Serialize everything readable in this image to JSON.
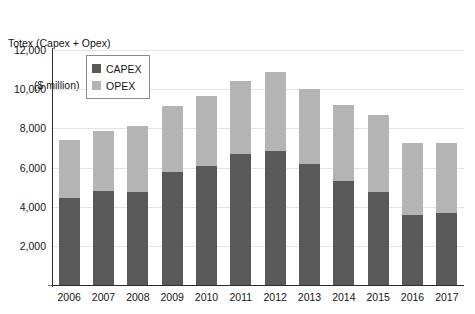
{
  "chart_data": {
    "type": "bar",
    "subtype": "stacked-bar",
    "title": "Totex (Capex + Opex)",
    "subtitle": "($ million)",
    "xlabel": "",
    "ylabel": "Totex (Capex + Opex) ($ million)",
    "categories": [
      "2006",
      "2007",
      "2008",
      "2009",
      "2010",
      "2011",
      "2012",
      "2013",
      "2014",
      "2015",
      "2016",
      "2017"
    ],
    "series": [
      {
        "name": "CAPEX",
        "color": "#595959",
        "values": [
          4450,
          4800,
          4750,
          5750,
          6100,
          6700,
          6850,
          6200,
          5300,
          4750,
          3600,
          3700
        ]
      },
      {
        "name": "OPEX",
        "color": "#b4b4b4",
        "values": [
          2950,
          3050,
          3350,
          3400,
          3550,
          3700,
          4050,
          3800,
          3900,
          3950,
          3650,
          3550
        ]
      }
    ],
    "totals": [
      7400,
      7850,
      8100,
      9150,
      9650,
      10400,
      10900,
      10000,
      9200,
      8700,
      7250,
      7250
    ],
    "ylim": [
      0,
      12000
    ],
    "ytick_values": [
      2000,
      4000,
      6000,
      8000,
      10000,
      12000
    ],
    "ytick_labels": [
      "2,000",
      "4,000",
      "6,000",
      "8,000",
      "10,000",
      "12,000"
    ],
    "grid": true,
    "grid_color": "#e4e4e4",
    "legend_position": "top-left",
    "legend_entries": [
      "CAPEX",
      "OPEX"
    ]
  },
  "legend": {
    "items": [
      {
        "label": "CAPEX",
        "color": "#595959"
      },
      {
        "label": "OPEX",
        "color": "#b4b4b4"
      }
    ]
  },
  "axis": {
    "line_color": "#2b2b2b"
  }
}
